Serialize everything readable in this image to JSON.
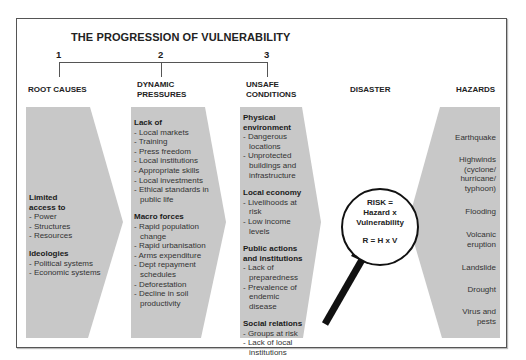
{
  "title": "THE PROGRESSION OF VULNERABILITY",
  "stages": [
    {
      "number": "1",
      "heading": "ROOT CAUSES"
    },
    {
      "number": "2",
      "heading_line1": "DYNAMIC",
      "heading_line2": "PRESSURES"
    },
    {
      "number": "3",
      "heading_line1": "UNSAFE",
      "heading_line2": "CONDITIONS"
    }
  ],
  "disaster_heading": "DISASTER",
  "hazards_heading": "HAZARDS",
  "root_causes": {
    "groups": [
      {
        "heading_line1": "Limited",
        "heading_line2": "access to",
        "items": [
          "- Power",
          "- Structures",
          "- Resources"
        ]
      },
      {
        "heading": "Ideologies",
        "items": [
          "- Political systems",
          "- Economic systems"
        ]
      }
    ]
  },
  "dynamic_pressures": {
    "groups": [
      {
        "heading": "Lack of",
        "items": [
          "- Local markets",
          "- Training",
          "- Press freedom",
          "- Local institutions",
          "- Appropriate skills",
          "- Local investments",
          "- Ethical standards in public life"
        ]
      },
      {
        "heading": "Macro forces",
        "items": [
          "- Rapid population change",
          "- Rapid urbanisation",
          "- Arms expenditure",
          "- Dept repayment schedules",
          "- Deforestation",
          "- Decline in soil productivity"
        ]
      }
    ]
  },
  "unsafe_conditions": {
    "groups": [
      {
        "heading": "Physical environment",
        "items": [
          "- Dangerous locations",
          "- Unprotected buildings and infrastructure"
        ]
      },
      {
        "heading": "Local economy",
        "items": [
          "- Livelihoods at risk",
          "- Low income levels"
        ]
      },
      {
        "heading": "Public actions and institutions",
        "items": [
          "- Lack of preparedness",
          "- Prevalence of endemic disease"
        ]
      },
      {
        "heading": "Social relations",
        "items": [
          "- Groups at risk",
          "- Lack of local institutions"
        ]
      }
    ]
  },
  "risk": {
    "line1": "RISK =",
    "line2": "Hazard x",
    "line3": "Vulnerability",
    "formula": "R = H x V"
  },
  "hazards": [
    "Earthquake",
    "Highwinds (cyclone/ hurricane/ typhoon)",
    "Flooding",
    "Volcanic eruption",
    "Landslide",
    "Drought",
    "Virus and pests"
  ],
  "colors": {
    "shape_fill": "#c8c8c8",
    "border": "#555555",
    "text": "#333333"
  }
}
